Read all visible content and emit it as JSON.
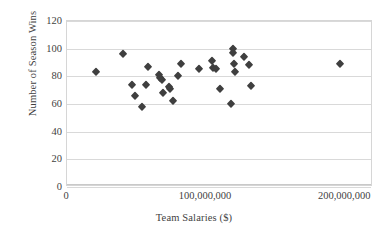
{
  "chart_data": {
    "type": "scatter",
    "title": "",
    "xlabel": "Team Salaries ($)",
    "ylabel": "Number of Season Wins",
    "xlim": [
      0,
      220000000
    ],
    "ylim": [
      0,
      120
    ],
    "grid": true,
    "legend": false,
    "marker": {
      "shape": "diamond",
      "color": "#3f3f3f",
      "size": 6
    },
    "xticks": [
      {
        "value": 0,
        "label": "0"
      },
      {
        "value": 100000000,
        "label": "100,000,000"
      },
      {
        "value": 200000000,
        "label": "200,000,000"
      }
    ],
    "yticks": [
      {
        "value": 0,
        "label": "0"
      },
      {
        "value": 20,
        "label": "20"
      },
      {
        "value": 40,
        "label": "40"
      },
      {
        "value": 60,
        "label": "60"
      },
      {
        "value": 80,
        "label": "80"
      },
      {
        "value": 100,
        "label": "100"
      },
      {
        "value": 120,
        "label": "120"
      }
    ],
    "points": [
      {
        "x": 21000000,
        "y": 83
      },
      {
        "x": 40000000,
        "y": 96
      },
      {
        "x": 47000000,
        "y": 74
      },
      {
        "x": 49000000,
        "y": 66
      },
      {
        "x": 54000000,
        "y": 58
      },
      {
        "x": 57000000,
        "y": 74
      },
      {
        "x": 58000000,
        "y": 87
      },
      {
        "x": 66000000,
        "y": 81
      },
      {
        "x": 67000000,
        "y": 79
      },
      {
        "x": 68000000,
        "y": 77
      },
      {
        "x": 69000000,
        "y": 68
      },
      {
        "x": 73000000,
        "y": 72
      },
      {
        "x": 74000000,
        "y": 71
      },
      {
        "x": 76000000,
        "y": 62
      },
      {
        "x": 80000000,
        "y": 80
      },
      {
        "x": 82000000,
        "y": 89
      },
      {
        "x": 95000000,
        "y": 85
      },
      {
        "x": 104000000,
        "y": 91
      },
      {
        "x": 105000000,
        "y": 86
      },
      {
        "x": 107000000,
        "y": 85
      },
      {
        "x": 110000000,
        "y": 71
      },
      {
        "x": 118000000,
        "y": 60
      },
      {
        "x": 119000000,
        "y": 100
      },
      {
        "x": 119500000,
        "y": 97
      },
      {
        "x": 120000000,
        "y": 89
      },
      {
        "x": 120500000,
        "y": 83
      },
      {
        "x": 127000000,
        "y": 94
      },
      {
        "x": 131000000,
        "y": 88
      },
      {
        "x": 132000000,
        "y": 73
      },
      {
        "x": 196000000,
        "y": 89
      }
    ]
  }
}
